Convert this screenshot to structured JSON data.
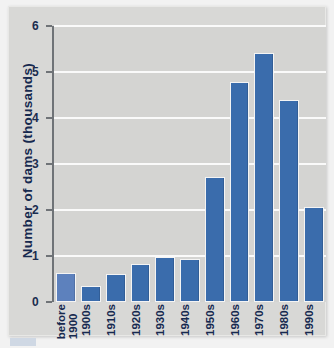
{
  "chart_data": {
    "type": "bar",
    "title": "",
    "xlabel": "",
    "ylabel": "Number of dams (thousands)",
    "categories": [
      "before 1900",
      "1900s",
      "1910s",
      "1920s",
      "1930s",
      "1940s",
      "1950s",
      "1960s",
      "1970s",
      "1980s",
      "1990s"
    ],
    "category_lines": [
      [
        "before",
        "1900"
      ],
      [
        "1900s"
      ],
      [
        "1910s"
      ],
      [
        "1920s"
      ],
      [
        "1930s"
      ],
      [
        "1940s"
      ],
      [
        "1950s"
      ],
      [
        "1960s"
      ],
      [
        "1970s"
      ],
      [
        "1980s"
      ],
      [
        "1990s"
      ]
    ],
    "values": [
      0.62,
      0.34,
      0.6,
      0.82,
      0.97,
      0.93,
      2.72,
      4.78,
      5.41,
      4.4,
      2.07
    ],
    "ylim": [
      0,
      6
    ],
    "ytick_labels": [
      "0",
      "1",
      "2",
      "3",
      "4",
      "5",
      "6"
    ],
    "ytick_values": [
      0,
      1,
      2,
      3,
      4,
      5,
      6
    ],
    "grid": "horizontal",
    "legend": "none",
    "bar_color": "#3a6cac",
    "first_bar_color": "#5d81bd",
    "grid_color": "#fafafa",
    "plot_background": "#d4d4d2",
    "axis_color": "#6f7377",
    "text_color": "#16294f"
  }
}
